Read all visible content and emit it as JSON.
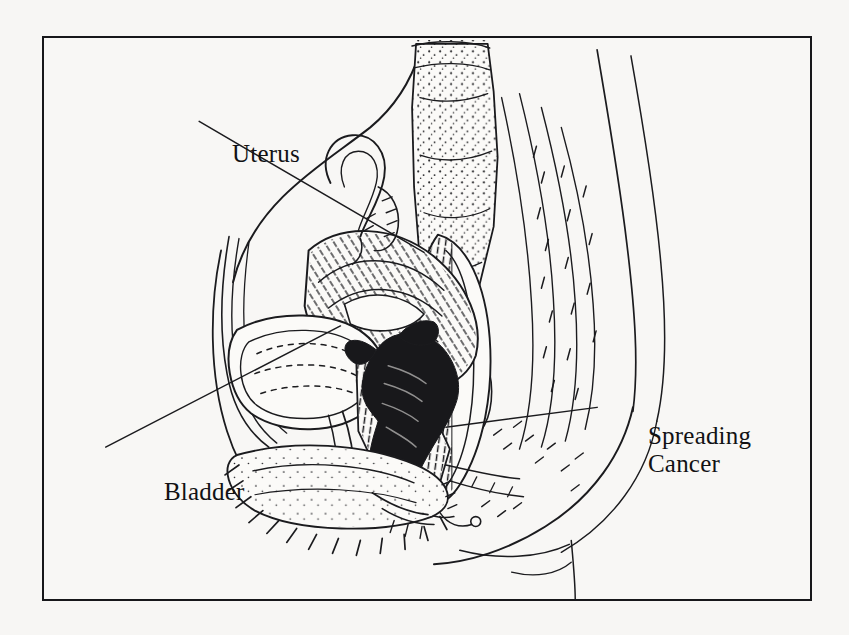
{
  "figure": {
    "kind": "anatomical-line-drawing",
    "view": "mid-sagittal section of the female pelvis",
    "style": "black-and-white scanned pen-and-ink engraving",
    "background_color": "#f7f6f4",
    "ink_color": "#18181b",
    "frame": {
      "border_color": "#17171a",
      "border_width_px": 2,
      "x": 42,
      "y": 36,
      "width": 770,
      "height": 565
    }
  },
  "labels": {
    "uterus": {
      "text": "Uterus",
      "x": 188,
      "y": 102,
      "leader_from": [
        293,
        137
      ],
      "leader_to": [
        417,
        239
      ]
    },
    "bladder": {
      "text": "Bladder",
      "x": 120,
      "y": 440,
      "leader_from": [
        196,
        437
      ],
      "leader_to": [
        330,
        322
      ]
    },
    "spreading_cancer": {
      "text": "Spreading\nCancer",
      "line1": "Spreading",
      "line2": "Cancer",
      "x": 604,
      "y": 384,
      "leader_from": [
        596,
        413
      ],
      "leader_to": [
        448,
        427
      ]
    }
  },
  "structures": [
    {
      "name": "abdominal-wall",
      "description": "anterior abdominal wall drawn as nested contour lines down the left side"
    },
    {
      "name": "uterus",
      "description": "anteverted uterine body with dense curved hatching"
    },
    {
      "name": "fallopian-tube-ovary",
      "description": "looped tube and small ovary above the uterine fundus"
    },
    {
      "name": "bladder",
      "description": "urinary bladder anterior to the uterus with stippled wall"
    },
    {
      "name": "cervix-tumor",
      "description": "solid black irregular mass at the cervix extending into the parametrium"
    },
    {
      "name": "vagina",
      "description": "hatched canal running downward from the cervix"
    },
    {
      "name": "rectum",
      "description": "posterior hatched rectal canal"
    },
    {
      "name": "sacrum",
      "description": "stippled sacral bone at upper right"
    },
    {
      "name": "coccyx",
      "description": "small stippled segments below the sacrum"
    },
    {
      "name": "pubic-bone",
      "description": "hatched pubic symphysis at lower centre-left"
    },
    {
      "name": "buttock-contour",
      "description": "long outer body curve sweeping to the lower right"
    },
    {
      "name": "urethra",
      "description": "short channel from bladder neck to the perineum"
    }
  ]
}
